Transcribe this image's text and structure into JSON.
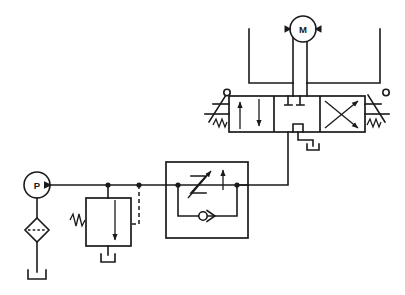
{
  "diagram": {
    "caption": "",
    "background_color": "#ffffff",
    "line_color": "#1a1a1a",
    "width": 405,
    "height": 295
  },
  "components": {
    "pump": {
      "label": "P",
      "name": "hydraulic-pump",
      "description": "Fixed displacement hydraulic pump, unidirectional",
      "cx": 37,
      "cy": 185,
      "r": 13
    },
    "motor": {
      "label": "M",
      "name": "hydraulic-motor",
      "description": "Bidirectional hydraulic motor",
      "cx": 303,
      "cy": 29,
      "r": 13
    },
    "filter": {
      "label": "",
      "name": "filter-strainer",
      "description": "Filter / strainer with dashed element line",
      "cx": 37,
      "cy": 230,
      "half": 12
    },
    "relief_valve": {
      "label": "",
      "name": "pressure-relief-valve",
      "description": "Pressure relief valve, spring loaded, externally piloted, drains to tank",
      "x": 86,
      "y": 198,
      "w": 45,
      "h": 48
    },
    "flow_control": {
      "label": "",
      "name": "pressure-compensated-flow-control-valve",
      "description": "Pressure compensated adjustable flow control valve with integral bypass check valve",
      "x": 166,
      "y": 162,
      "w": 82,
      "h": 76
    },
    "check_valve": {
      "label": "",
      "name": "bypass-check-valve",
      "description": "Free reverse flow check valve in bypass leg"
    },
    "directional_valve": {
      "label": "",
      "name": "directional-control-valve",
      "description": "4-way 3-position closed center directional control valve, lever actuated with spring centering",
      "x": 229,
      "y": 96,
      "w": 136,
      "h": 36,
      "positions": [
        "parallel-flow",
        "closed-center",
        "crossed-flow"
      ],
      "actuator_left": "lever-with-spring-return",
      "actuator_right": "lever-with-spring-return"
    },
    "reservoir_pump": {
      "name": "reservoir-pump-inlet",
      "description": "Open reservoir at pump suction"
    },
    "reservoir_relief": {
      "name": "reservoir-relief-drain",
      "description": "Open reservoir at relief valve drain"
    },
    "reservoir_valve": {
      "name": "reservoir-valve-tank-port",
      "description": "Open reservoir at directional valve tank port"
    }
  },
  "lines": {
    "pressure_line": {
      "name": "main-pressure-line",
      "description": "Pump discharge to flow control and directional valve P port"
    },
    "pilot_line": {
      "name": "relief-pilot-line",
      "description": "Dashed pilot line sensing main pressure"
    },
    "motor_line_a": {
      "name": "motor-line-a",
      "description": "Valve port A to motor"
    },
    "motor_line_b": {
      "name": "motor-line-b",
      "description": "Valve port B to motor"
    },
    "suction_line": {
      "name": "pump-suction-line",
      "description": "Reservoir through filter to pump inlet"
    }
  },
  "junctions": [
    {
      "name": "junction-relief-tap",
      "x": 108,
      "y": 185
    },
    {
      "name": "junction-pilot-tap",
      "x": 139,
      "y": 185
    },
    {
      "name": "junction-flowcontrol-inlet",
      "x": 178,
      "y": 185
    },
    {
      "name": "junction-flowcontrol-outlet",
      "x": 237,
      "y": 185
    }
  ],
  "icons": {
    "pump_arrow": "pump-flow-arrow-icon",
    "motor_arrow_left": "motor-flow-arrow-left-icon",
    "motor_arrow_right": "motor-flow-arrow-right-icon",
    "lever_left": "lever-actuator-left-icon",
    "lever_right": "lever-actuator-right-icon",
    "spring_left": "spring-return-left-icon",
    "spring_right": "spring-return-right-icon",
    "restrictor": "variable-restrictor-icon",
    "compensator_arrow": "compensator-arrow-icon",
    "check_ball": "check-valve-ball-icon",
    "relief_arrow": "relief-valve-arrow-icon",
    "tank_symbol": "reservoir-tank-icon"
  }
}
